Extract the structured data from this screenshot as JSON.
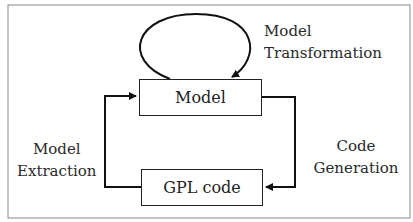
{
  "diagram": {
    "nodes": {
      "model": {
        "label": "Model"
      },
      "gpl": {
        "label": "GPL code"
      }
    },
    "edges": {
      "transformation": {
        "line1": "Model",
        "line2": "Transformation",
        "from": "Model",
        "to": "Model"
      },
      "generation": {
        "line1": "Code",
        "line2": "Generation",
        "from": "Model",
        "to": "GPL code"
      },
      "extraction": {
        "line1": "Model",
        "line2": "Extraction",
        "from": "GPL code",
        "to": "Model"
      }
    }
  }
}
